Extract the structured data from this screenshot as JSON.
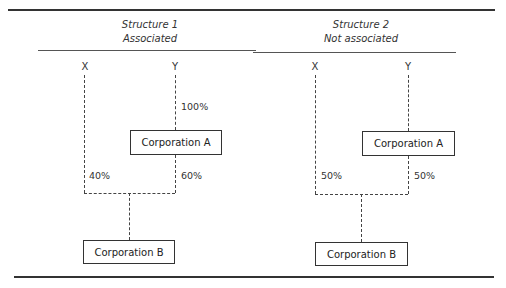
{
  "structures": [
    {
      "title": "Structure 1",
      "subtitle": "Associated",
      "shareholders": {
        "x": "X",
        "y": "Y"
      },
      "percentages": {
        "y_to_a": "100%",
        "x_to_b": "40%",
        "a_to_b": "60%"
      },
      "entities": {
        "a": "Corporation A",
        "b": "Corporation B"
      }
    },
    {
      "title": "Structure 2",
      "subtitle": "Not associated",
      "shareholders": {
        "x": "X",
        "y": "Y"
      },
      "percentages": {
        "x_to_b": "50%",
        "a_to_b": "50%"
      },
      "entities": {
        "a": "Corporation A",
        "b": "Corporation B"
      }
    }
  ]
}
